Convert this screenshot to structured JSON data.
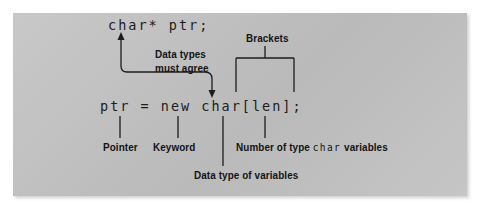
{
  "figure": {
    "panel_color": "#c2c2c2",
    "ink_color": "#141414",
    "page_color": "#ffffff"
  },
  "code": {
    "line1": "char* ptr;",
    "line2": "ptr = new char[len];"
  },
  "annotations": {
    "data_types_line1": "Data types",
    "data_types_line2": "must agree",
    "brackets": "Brackets",
    "pointer": "Pointer",
    "keyword": "Keyword",
    "number_prefix": "Number of type ",
    "number_code": "char",
    "number_suffix": " variables",
    "data_type_of_variables": "Data type of variables"
  }
}
